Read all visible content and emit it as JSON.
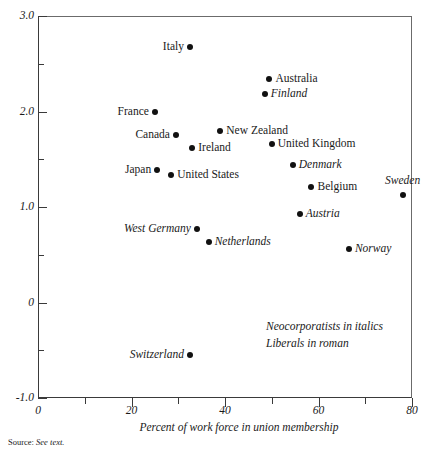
{
  "chart_data": {
    "type": "scatter",
    "title": "",
    "xlabel": "Percent of work force in union membership",
    "ylabel": "",
    "xlim": [
      0,
      80
    ],
    "ylim": [
      -1.0,
      3.0
    ],
    "xticks": [
      0,
      20,
      40,
      60,
      80
    ],
    "xticklabels": [
      "0",
      "20",
      "40",
      "60",
      "80"
    ],
    "xminorticks": [
      10,
      30,
      50,
      70
    ],
    "yticks": [
      -1.0,
      0,
      1.0,
      2.0,
      3.0
    ],
    "yticklabels": [
      "-1.0",
      "0",
      "1.0",
      "2.0",
      "3.0"
    ],
    "yminorticks": [
      -0.5,
      0.5,
      1.5,
      2.5
    ],
    "grid": false,
    "legend_position": "inside-bottom-right",
    "annotations": [
      "Neocorporatists in italics",
      "Liberals in roman"
    ],
    "source_note_label": "Source:",
    "source_note_value": "See text.",
    "points": [
      {
        "label": "Italy",
        "x": 32.5,
        "y": 2.68,
        "style": "roman",
        "label_side": "left"
      },
      {
        "label": "Australia",
        "x": 49.5,
        "y": 2.34,
        "style": "roman",
        "label_side": "right"
      },
      {
        "label": "Finland",
        "x": 48.5,
        "y": 2.18,
        "style": "italic",
        "label_side": "right"
      },
      {
        "label": "France",
        "x": 25.0,
        "y": 2.0,
        "style": "roman",
        "label_side": "left"
      },
      {
        "label": "New Zealand",
        "x": 39.0,
        "y": 1.8,
        "style": "roman",
        "label_side": "right"
      },
      {
        "label": "Canada",
        "x": 29.5,
        "y": 1.75,
        "style": "roman",
        "label_side": "left"
      },
      {
        "label": "United Kingdom",
        "x": 50.0,
        "y": 1.66,
        "style": "roman",
        "label_side": "right"
      },
      {
        "label": "Ireland",
        "x": 33.0,
        "y": 1.62,
        "style": "roman",
        "label_side": "right"
      },
      {
        "label": "Denmark",
        "x": 54.5,
        "y": 1.44,
        "style": "italic",
        "label_side": "right"
      },
      {
        "label": "Japan",
        "x": 25.5,
        "y": 1.39,
        "style": "roman",
        "label_side": "left"
      },
      {
        "label": "United States",
        "x": 28.5,
        "y": 1.33,
        "style": "roman",
        "label_side": "right"
      },
      {
        "label": "Belgium",
        "x": 58.5,
        "y": 1.21,
        "style": "roman",
        "label_side": "right"
      },
      {
        "label": "Sweden",
        "x": 78.0,
        "y": 1.13,
        "style": "italic",
        "label_side": "above"
      },
      {
        "label": "Austria",
        "x": 56.0,
        "y": 0.93,
        "style": "italic",
        "label_side": "right"
      },
      {
        "label": "West Germany",
        "x": 34.0,
        "y": 0.77,
        "style": "italic",
        "label_side": "left"
      },
      {
        "label": "Netherlands",
        "x": 36.5,
        "y": 0.63,
        "style": "italic",
        "label_side": "right"
      },
      {
        "label": "Norway",
        "x": 66.5,
        "y": 0.56,
        "style": "italic",
        "label_side": "right"
      },
      {
        "label": "Switzerland",
        "x": 32.5,
        "y": -0.55,
        "style": "italic",
        "label_side": "left"
      }
    ]
  }
}
